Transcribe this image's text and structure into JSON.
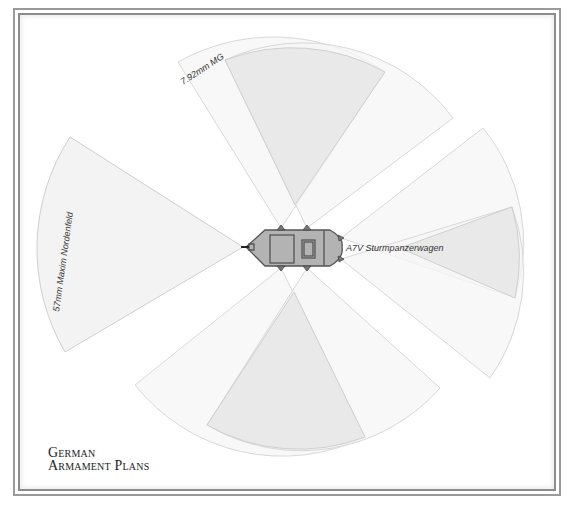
{
  "title": {
    "line1": "German",
    "line2": "Armament Plans"
  },
  "labels": {
    "vehicle": "A7V Sturmpanzerwagen",
    "mg": "7.92mm MG",
    "main_gun": "57mm Maxim Nordenfeld"
  },
  "colors": {
    "sector_fill": "#f5f5f5",
    "overlap_fill": "#e6e6e6",
    "hull_fill": "#b3b3b3",
    "hull_stroke": "#555555",
    "frame": "#9a9a9a"
  },
  "weapons": [
    {
      "name": "57mm Maxim Nordenfeld",
      "position": "front",
      "count": 1
    },
    {
      "name": "7.92mm MG",
      "position": "left side",
      "count": 2
    },
    {
      "name": "7.92mm MG",
      "position": "right side",
      "count": 2
    },
    {
      "name": "7.92mm MG",
      "position": "rear",
      "count": 2
    }
  ]
}
